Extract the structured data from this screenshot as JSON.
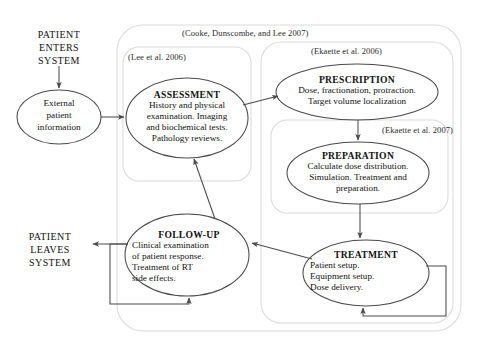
{
  "diagram": {
    "stroke_color": "#4a4a4a",
    "container_color": "#d8d8d8",
    "text_color": "#111111"
  },
  "containers": [
    {
      "id": "cooke",
      "label": "(Cooke, Dunscombe, and Lee 2007)",
      "x": 117,
      "y": 25,
      "w": 344,
      "h": 306,
      "label_x": 182,
      "label_y": 30
    },
    {
      "id": "lee",
      "label": "(Lee et al. 2006)",
      "x": 123,
      "y": 47,
      "w": 128,
      "h": 134,
      "label_x": 128,
      "label_y": 54
    },
    {
      "id": "ekaette2006",
      "label": "(Ekaette et al. 2006)",
      "x": 261,
      "y": 42,
      "w": 192,
      "h": 281,
      "label_x": 311,
      "label_y": 48
    },
    {
      "id": "ekaette2007",
      "label": "(Ekaette et al. 2007)",
      "x": 271,
      "y": 120,
      "w": 177,
      "h": 93,
      "label_x": 382,
      "label_y": 127
    }
  ],
  "system_labels": [
    {
      "id": "patient-enters",
      "lines": [
        "PATIENT",
        "ENTERS",
        "SYSTEM"
      ],
      "x": 19,
      "y": 28,
      "w": 90
    },
    {
      "id": "patient-leaves",
      "lines": [
        "PATIENT",
        "LEAVES",
        "SYSTEM"
      ],
      "x": 10,
      "y": 231,
      "w": 90
    }
  ],
  "nodes": [
    {
      "id": "external-patient-information",
      "kind": "plain",
      "title": "",
      "lines": [
        "External",
        "patient",
        "information"
      ],
      "cx": 59,
      "cy": 117,
      "rx": 42,
      "ry": 27
    },
    {
      "id": "assessment",
      "kind": "titled",
      "title": "ASSESSMENT",
      "lines": [
        "History and physical",
        "examination. Imaging",
        "and biochemical tests.",
        "Pathology reviews."
      ],
      "cx": 187,
      "cy": 118,
      "rx": 61,
      "ry": 40
    },
    {
      "id": "prescription",
      "kind": "titled",
      "title": "PRESCRIPTION",
      "lines": [
        "Dose, fractionation, protraction.",
        "Target volume localization"
      ],
      "cx": 357,
      "cy": 92,
      "rx": 81,
      "ry": 28
    },
    {
      "id": "preparation",
      "kind": "titled",
      "title": "PREPARATION",
      "lines": [
        "Calculate dose distribution.",
        "Simulation. Treatment and",
        "preparation."
      ],
      "cx": 358,
      "cy": 173,
      "rx": 71,
      "ry": 31
    },
    {
      "id": "treatment",
      "kind": "titled",
      "title": "TREATMENT",
      "lines": [
        "Patient setup.",
        "Equipment setup.",
        "Dose delivery."
      ],
      "cx": 366,
      "cy": 273,
      "rx": 63,
      "ry": 33
    },
    {
      "id": "follow-up",
      "kind": "titled",
      "title": "FOLLOW-UP",
      "lines": [
        "Clinical examination",
        "of patient response.",
        "Treatment of RT",
        "side effects."
      ],
      "cx": 187,
      "cy": 255,
      "rx": 62,
      "ry": 41
    }
  ],
  "edges": [
    {
      "id": "enter-to-external",
      "from": "patient-enters",
      "to": "external-patient-information"
    },
    {
      "id": "external-to-assessment",
      "from": "external-patient-information",
      "to": "assessment"
    },
    {
      "id": "assessment-to-prescription",
      "from": "assessment",
      "to": "prescription"
    },
    {
      "id": "prescription-to-preparation",
      "from": "prescription",
      "to": "preparation"
    },
    {
      "id": "preparation-to-treatment",
      "from": "preparation",
      "to": "treatment"
    },
    {
      "id": "treatment-to-followup",
      "from": "treatment",
      "to": "follow-up"
    },
    {
      "id": "followup-to-assessment",
      "from": "follow-up",
      "to": "assessment"
    },
    {
      "id": "followup-to-leaves",
      "from": "follow-up",
      "to": "patient-leaves"
    },
    {
      "id": "followup-self-loop",
      "from": "follow-up",
      "to": "follow-up"
    },
    {
      "id": "treatment-self-loop",
      "from": "treatment",
      "to": "treatment"
    }
  ]
}
